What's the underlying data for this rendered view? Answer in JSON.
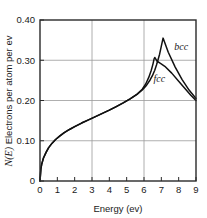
{
  "chart_data": {
    "type": "line",
    "title": "",
    "xlabel": "Energy (ev)",
    "ylabel": "N(E) Electrons per atom per ev",
    "ylabel_italic_part": "N(E)",
    "ylabel_plain_part": " Electrons per atom per ev",
    "xlim": [
      0,
      9
    ],
    "ylim": [
      0,
      0.4
    ],
    "xticks": [
      0,
      1,
      2,
      3,
      4,
      5,
      6,
      7,
      8,
      9
    ],
    "xticklabels": [
      "0",
      "1",
      "2",
      "3",
      "4",
      "5",
      "6",
      "7",
      "8",
      "9"
    ],
    "yticks": [
      0,
      0.1,
      0.2,
      0.3,
      0.4
    ],
    "yticklabels": [
      "0",
      "0.10",
      "0.20",
      "0.30",
      "0.40"
    ],
    "grid": true,
    "xgridlines": [
      3,
      6
    ],
    "ygridlines": [
      0.1,
      0.2,
      0.3
    ],
    "legend": "inline-annotations",
    "annotations": [
      {
        "text": "bcc",
        "x": 7.75,
        "y": 0.325
      },
      {
        "text": "fcc",
        "x": 6.55,
        "y": 0.245
      }
    ],
    "series": [
      {
        "name": "bcc",
        "color": "#111111",
        "points": [
          [
            0.0,
            0.0
          ],
          [
            0.05,
            0.03
          ],
          [
            0.1,
            0.042
          ],
          [
            0.2,
            0.057
          ],
          [
            0.35,
            0.071
          ],
          [
            0.5,
            0.083
          ],
          [
            0.7,
            0.094
          ],
          [
            0.9,
            0.103
          ],
          [
            1.15,
            0.112
          ],
          [
            1.4,
            0.12
          ],
          [
            1.7,
            0.128
          ],
          [
            2.0,
            0.135
          ],
          [
            2.4,
            0.144
          ],
          [
            2.8,
            0.152
          ],
          [
            3.2,
            0.16
          ],
          [
            3.6,
            0.168
          ],
          [
            4.0,
            0.176
          ],
          [
            4.4,
            0.185
          ],
          [
            4.8,
            0.194
          ],
          [
            5.2,
            0.204
          ],
          [
            5.6,
            0.215
          ],
          [
            5.9,
            0.226
          ],
          [
            6.15,
            0.238
          ],
          [
            6.35,
            0.251
          ],
          [
            6.5,
            0.263
          ],
          [
            6.62,
            0.275
          ],
          [
            6.72,
            0.288
          ],
          [
            6.8,
            0.3
          ],
          [
            6.9,
            0.315
          ],
          [
            7.0,
            0.335
          ],
          [
            7.1,
            0.355
          ],
          [
            7.4,
            0.32
          ],
          [
            7.8,
            0.283
          ],
          [
            8.2,
            0.252
          ],
          [
            8.6,
            0.226
          ],
          [
            9.0,
            0.205
          ]
        ]
      },
      {
        "name": "fcc",
        "color": "#111111",
        "points": [
          [
            0.0,
            0.0
          ],
          [
            0.05,
            0.03
          ],
          [
            0.1,
            0.042
          ],
          [
            0.2,
            0.057
          ],
          [
            0.35,
            0.071
          ],
          [
            0.5,
            0.083
          ],
          [
            0.7,
            0.094
          ],
          [
            0.9,
            0.103
          ],
          [
            1.15,
            0.112
          ],
          [
            1.4,
            0.12
          ],
          [
            1.7,
            0.128
          ],
          [
            2.0,
            0.135
          ],
          [
            2.4,
            0.144
          ],
          [
            2.8,
            0.152
          ],
          [
            3.2,
            0.16
          ],
          [
            3.6,
            0.168
          ],
          [
            4.0,
            0.176
          ],
          [
            4.4,
            0.185
          ],
          [
            4.8,
            0.194
          ],
          [
            5.2,
            0.204
          ],
          [
            5.6,
            0.216
          ],
          [
            5.9,
            0.228
          ],
          [
            6.1,
            0.241
          ],
          [
            6.28,
            0.258
          ],
          [
            6.42,
            0.275
          ],
          [
            6.52,
            0.291
          ],
          [
            6.58,
            0.303
          ],
          [
            6.62,
            0.307
          ],
          [
            6.75,
            0.298
          ],
          [
            6.95,
            0.292
          ],
          [
            7.2,
            0.285
          ],
          [
            7.6,
            0.268
          ],
          [
            8.0,
            0.248
          ],
          [
            8.4,
            0.228
          ],
          [
            8.7,
            0.213
          ],
          [
            9.0,
            0.2
          ]
        ]
      }
    ]
  },
  "layout": {
    "plot_left": 40,
    "plot_right": 196,
    "plot_top": 20,
    "plot_bottom": 181
  }
}
